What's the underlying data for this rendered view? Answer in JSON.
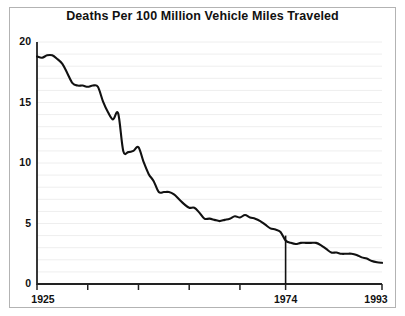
{
  "chart_data": {
    "type": "line",
    "title": "Deaths Per 100 Million Vehicle Miles Traveled",
    "xlabel": "",
    "ylabel": "",
    "xlim": [
      1925,
      1993
    ],
    "ylim": [
      0,
      20
    ],
    "grid": true,
    "grid_interval": 1,
    "legend": "none",
    "y_ticks": [
      0,
      5,
      10,
      15,
      20
    ],
    "y_tick_labels": [
      "0",
      "5",
      "10",
      "15",
      "20"
    ],
    "x_ticks": [
      1925,
      1935,
      1945,
      1955,
      1965,
      1974,
      1993
    ],
    "x_tick_labels_shown": [
      "1925",
      "1974",
      "1993"
    ],
    "annotations": [
      {
        "name": "vertical-marker-1974",
        "type": "vline",
        "x": 1974,
        "y_top": 4.0,
        "y_bottom": 0,
        "label": "1974"
      }
    ],
    "x": [
      1925,
      1926,
      1927,
      1928,
      1929,
      1930,
      1931,
      1932,
      1933,
      1934,
      1935,
      1936,
      1937,
      1938,
      1939,
      1940,
      1941,
      1942,
      1943,
      1944,
      1945,
      1946,
      1947,
      1948,
      1949,
      1950,
      1951,
      1952,
      1953,
      1954,
      1955,
      1956,
      1957,
      1958,
      1959,
      1960,
      1961,
      1962,
      1963,
      1964,
      1965,
      1966,
      1967,
      1968,
      1969,
      1970,
      1971,
      1972,
      1973,
      1974,
      1975,
      1976,
      1977,
      1978,
      1979,
      1980,
      1981,
      1982,
      1983,
      1984,
      1985,
      1986,
      1987,
      1988,
      1989,
      1990,
      1991,
      1992,
      1993
    ],
    "values": [
      18.8,
      18.7,
      18.9,
      18.9,
      18.6,
      18.2,
      17.4,
      16.6,
      16.4,
      16.4,
      16.3,
      16.4,
      16.3,
      15.1,
      14.2,
      13.6,
      14.1,
      11.0,
      10.9,
      11.0,
      11.3,
      10.1,
      9.1,
      8.5,
      7.6,
      7.6,
      7.6,
      7.4,
      7.0,
      6.6,
      6.3,
      6.3,
      5.9,
      5.4,
      5.4,
      5.3,
      5.2,
      5.3,
      5.4,
      5.6,
      5.5,
      5.7,
      5.5,
      5.4,
      5.2,
      4.9,
      4.6,
      4.5,
      4.3,
      3.6,
      3.4,
      3.3,
      3.4,
      3.4,
      3.4,
      3.4,
      3.2,
      2.9,
      2.6,
      2.6,
      2.5,
      2.5,
      2.5,
      2.4,
      2.2,
      2.1,
      1.9,
      1.8,
      1.75
    ]
  },
  "axis": {
    "y_labels": [
      "20",
      "15",
      "10",
      "5",
      "0"
    ],
    "x_labels": [
      "1925",
      "1974",
      "1993"
    ]
  },
  "colors": {
    "line": "#111111",
    "grid": "#eeeeee",
    "axis": "#222222",
    "frame": "#b3b3b3",
    "background": "#ffffff"
  }
}
